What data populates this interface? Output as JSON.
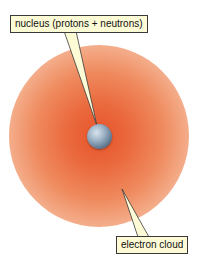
{
  "diagram": {
    "labels": {
      "nucleus": "nucleus (protons + neutrons)",
      "electron_cloud": "electron cloud"
    },
    "colors": {
      "cloud_core": "#e8532a",
      "cloud_edge": "#f4b08e",
      "nucleus": "#7a90a6",
      "label_bg": "#fdfbd6",
      "label_border": "#3a3a3a"
    }
  }
}
